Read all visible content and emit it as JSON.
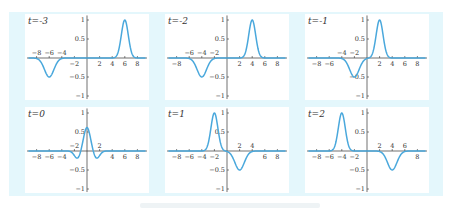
{
  "figure": {
    "background_color": "#e4f7fc",
    "panel_color": "#ffffff",
    "line_color": "#4aa8dc",
    "axis_color": "#333333"
  },
  "chart_data": [
    {
      "type": "line",
      "title": "t=-3",
      "label": "t=-3",
      "x_ticks": [
        -8,
        -4,
        -6,
        -2,
        2,
        4,
        6,
        8
      ],
      "y_ticks": [
        1,
        0.5,
        -0.5,
        -1
      ],
      "xlim": [
        -9,
        9
      ],
      "ylim": [
        -1,
        1
      ],
      "features": [
        {
          "x": -6,
          "y": -0.5,
          "kind": "trough"
        },
        {
          "x": 6,
          "y": 1,
          "kind": "peak"
        }
      ]
    },
    {
      "type": "line",
      "title": "t=-2",
      "label": "t=-2",
      "x_ticks": [
        -8,
        -6,
        -4,
        -2,
        2,
        4,
        6,
        8
      ],
      "y_ticks": [
        1,
        0.5,
        -0.5,
        -1
      ],
      "xlim": [
        -9,
        9
      ],
      "ylim": [
        -1,
        1
      ],
      "features": [
        {
          "x": -4,
          "y": -0.5,
          "kind": "trough"
        },
        {
          "x": 4,
          "y": 1,
          "kind": "peak"
        }
      ]
    },
    {
      "type": "line",
      "title": "t=-1",
      "label": "t=-1",
      "x_ticks": [
        -8,
        -6,
        -4,
        -2,
        2,
        4,
        6,
        8
      ],
      "y_ticks": [
        1,
        0.5,
        -0.5,
        -1
      ],
      "xlim": [
        -9,
        9
      ],
      "ylim": [
        -1,
        1
      ],
      "features": [
        {
          "x": -2,
          "y": -0.5,
          "kind": "trough"
        },
        {
          "x": 2,
          "y": 1,
          "kind": "peak"
        }
      ]
    },
    {
      "type": "line",
      "title": "t=0",
      "label": "t=0",
      "x_ticks": [
        -8,
        -6,
        -4,
        -2,
        2,
        4,
        6,
        8
      ],
      "y_ticks": [
        1,
        0.5,
        -0.5,
        -1
      ],
      "xlim": [
        -9,
        9
      ],
      "ylim": [
        -1,
        1
      ],
      "features": [
        {
          "x": 0,
          "y": 0.5,
          "kind": "peak"
        },
        {
          "x": -1.5,
          "y": -0.12,
          "kind": "trough"
        },
        {
          "x": 1.5,
          "y": -0.12,
          "kind": "trough"
        }
      ]
    },
    {
      "type": "line",
      "title": "t=1",
      "label": "t=1",
      "x_ticks": [
        -8,
        -6,
        -4,
        -2,
        2,
        4,
        6,
        8
      ],
      "y_ticks": [
        1,
        0.5,
        -0.5,
        -1
      ],
      "xlim": [
        -9,
        9
      ],
      "ylim": [
        -1,
        1
      ],
      "features": [
        {
          "x": -2,
          "y": 1,
          "kind": "peak"
        },
        {
          "x": 2,
          "y": -0.5,
          "kind": "trough"
        }
      ]
    },
    {
      "type": "line",
      "title": "t=2",
      "label": "t=2",
      "x_ticks": [
        -8,
        -6,
        -4,
        -2,
        2,
        4,
        6,
        8
      ],
      "y_ticks": [
        1,
        0.5,
        -0.5,
        -1
      ],
      "xlim": [
        -9,
        9
      ],
      "ylim": [
        -1,
        1
      ],
      "features": [
        {
          "x": -4,
          "y": 1,
          "kind": "peak"
        },
        {
          "x": 4,
          "y": -0.5,
          "kind": "trough"
        }
      ]
    }
  ],
  "panels": [
    {
      "label": "t=-3"
    },
    {
      "label": "t=-2"
    },
    {
      "label": "t=-1"
    },
    {
      "label": "t=0"
    },
    {
      "label": "t=1"
    },
    {
      "label": "t=2"
    }
  ]
}
